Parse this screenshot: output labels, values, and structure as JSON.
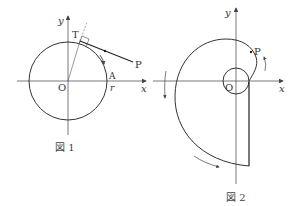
{
  "figures": [
    {
      "caption": "図 1",
      "labels": {
        "y_axis": "y",
        "x_axis": "x",
        "origin": "O",
        "tangent_point": "T",
        "point_p": "P",
        "point_a": "A",
        "radius": "r"
      }
    },
    {
      "caption": "図 2",
      "labels": {
        "y_axis": "y",
        "x_axis": "x",
        "origin": "O",
        "point_p": "P"
      }
    }
  ],
  "colors": {
    "stroke": "#333333",
    "axis": "#555555",
    "background": "#ffffff"
  }
}
